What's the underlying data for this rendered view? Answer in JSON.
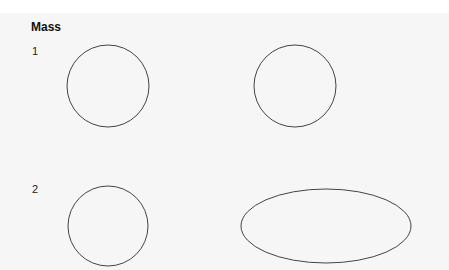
{
  "title": "Mass",
  "rows": [
    {
      "label": "1",
      "shapes": [
        {
          "type": "circle",
          "cx": 108,
          "cy": 86,
          "r": 41
        },
        {
          "type": "circle",
          "cx": 295,
          "cy": 86,
          "r": 41
        }
      ]
    },
    {
      "label": "2",
      "shapes": [
        {
          "type": "circle",
          "cx": 108,
          "cy": 226,
          "r": 40
        },
        {
          "type": "ellipse",
          "cx": 326,
          "cy": 226,
          "rx": 85,
          "ry": 37
        }
      ]
    }
  ],
  "colors": {
    "stroke": "#444444",
    "panel_bg": "#f6f6f6"
  }
}
